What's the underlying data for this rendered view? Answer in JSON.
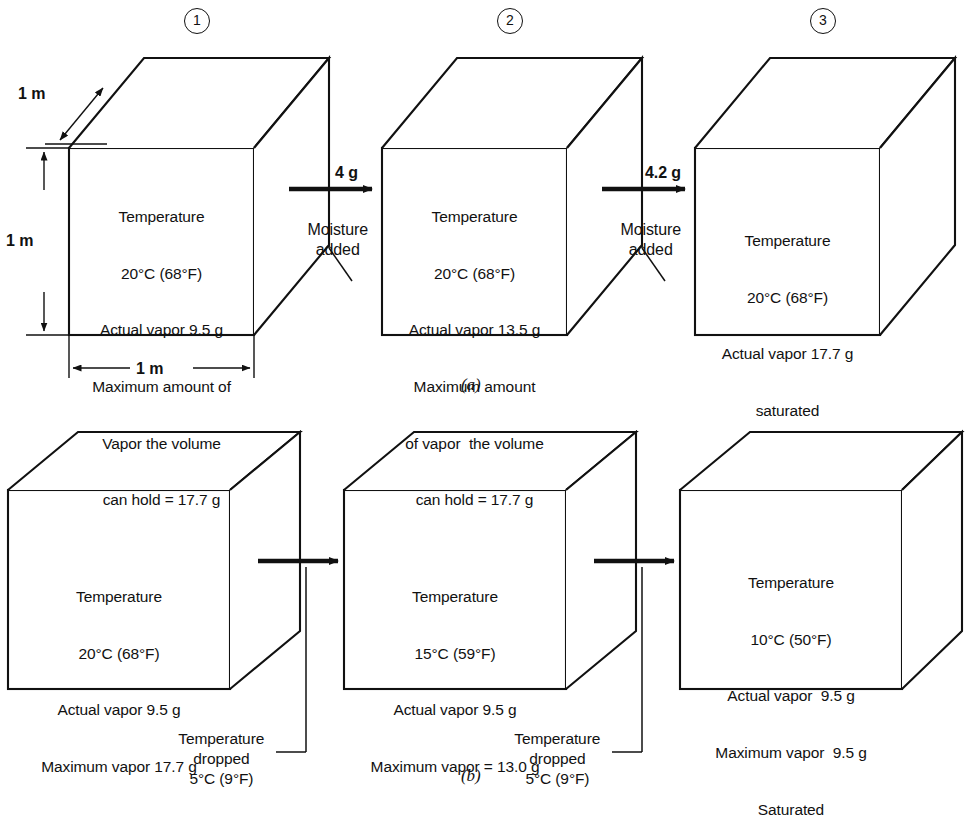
{
  "figure": {
    "panels": [
      {
        "caption": "(a)"
      },
      {
        "caption": "(b)"
      }
    ]
  },
  "panel_a": {
    "caption": "(a)",
    "dimensions": {
      "depth_label": "1 m",
      "height_label": "1 m",
      "width_label": "1 m"
    },
    "step_numbers": [
      "1",
      "2",
      "3"
    ],
    "cubes": [
      {
        "step": "1",
        "lines": [
          "Temperature",
          "20°C (68°F)",
          "Actual vapor 9.5 g",
          "Maximum amount of",
          "Vapor the volume",
          "can hold = 17.7 g"
        ]
      },
      {
        "step": "2",
        "lines": [
          "Temperature",
          "20°C (68°F)",
          "Actual vapor 13.5 g",
          "Maximum amount",
          "of vapor  the volume",
          "can hold = 17.7 g"
        ]
      },
      {
        "step": "3",
        "lines": [
          "Temperature",
          "20°C (68°F)",
          "Actual vapor 17.7 g",
          "saturated"
        ]
      }
    ],
    "transitions": [
      {
        "amount": "4 g",
        "caption_line1": "Moisture",
        "caption_line2": "added"
      },
      {
        "amount": "4.2 g",
        "caption_line1": "Moisture",
        "caption_line2": "added"
      }
    ]
  },
  "panel_b": {
    "caption": "(b)",
    "cubes": [
      {
        "lines": [
          "Temperature",
          "20°C (68°F)",
          "Actual vapor 9.5 g",
          "Maximum vapor 17.7 g"
        ]
      },
      {
        "lines": [
          "Temperature",
          "15°C (59°F)",
          "Actual vapor 9.5 g",
          "Maximum vapor = 13.0 g"
        ]
      },
      {
        "lines": [
          "Temperature",
          "10°C (50°F)",
          "Actual vapor  9.5 g",
          "Maximum vapor  9.5 g",
          "Saturated"
        ]
      }
    ],
    "transitions": [
      {
        "caption_line1": "Temperature",
        "caption_line2": "dropped",
        "caption_line3": "5°C (9°F)"
      },
      {
        "caption_line1": "Temperature",
        "caption_line2": "dropped",
        "caption_line3": "5°C (9°F)"
      }
    ]
  },
  "colors": {
    "ink": "#111111",
    "paper": "#ffffff"
  }
}
